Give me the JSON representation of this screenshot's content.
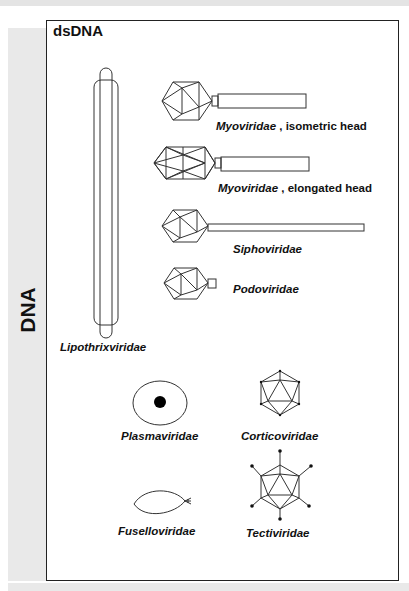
{
  "section": {
    "category": "DNA",
    "group_title": "dsDNA"
  },
  "families": [
    {
      "id": "myo-iso",
      "name": "Myoviridae",
      "suffix": " ,  isometric head"
    },
    {
      "id": "myo-elong",
      "name": "Myoviridae",
      "suffix": " , elongated head"
    },
    {
      "id": "sipho",
      "name": "Siphoviridae",
      "suffix": ""
    },
    {
      "id": "podo",
      "name": "Podoviridae",
      "suffix": ""
    },
    {
      "id": "lipo",
      "name": "Lipothrixviridae",
      "suffix": ""
    },
    {
      "id": "plasma",
      "name": "Plasmaviridae",
      "suffix": ""
    },
    {
      "id": "cortico",
      "name": "Corticoviridae",
      "suffix": ""
    },
    {
      "id": "fusello",
      "name": "Fuselloviridae",
      "suffix": ""
    },
    {
      "id": "tecti",
      "name": "Tectiviridae",
      "suffix": ""
    }
  ],
  "colors": {
    "line": "#333333",
    "background_band": "#e9e9e9",
    "frame_border": "#222222"
  }
}
